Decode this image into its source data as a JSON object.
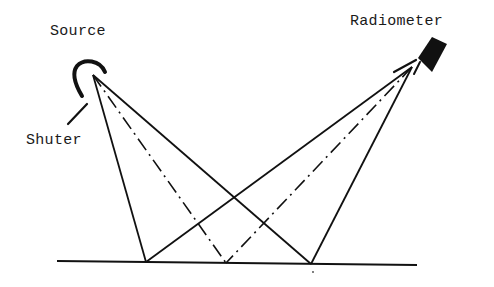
{
  "diagram": {
    "title": "",
    "labels": {
      "source": "Source",
      "shuter": "Shuter",
      "radiometer": "Radiometer"
    },
    "components": [
      {
        "name": "source",
        "icon": "lamp-reflector-icon"
      },
      {
        "name": "shutter",
        "icon": "shutter-arm-icon"
      },
      {
        "name": "radiometer",
        "icon": "radiometer-detector-icon"
      },
      {
        "name": "ground-surface",
        "icon": "surface-line"
      }
    ],
    "geometry": {
      "source_apex": [
        93,
        75
      ],
      "radiometer_apex": [
        412,
        67
      ],
      "surface_line": [
        [
          57,
          261
        ],
        [
          417,
          265
        ]
      ],
      "surface_points": {
        "left": [
          146,
          262
        ],
        "center": [
          226,
          263
        ],
        "right": [
          311,
          264
        ]
      }
    },
    "rays": [
      {
        "from": "source",
        "to": "left",
        "style": "solid"
      },
      {
        "from": "source",
        "to": "center",
        "style": "dash-dot"
      },
      {
        "from": "source",
        "to": "right",
        "style": "solid"
      },
      {
        "from": "radiometer",
        "to": "left",
        "style": "solid"
      },
      {
        "from": "radiometer",
        "to": "center",
        "style": "dash-dot"
      },
      {
        "from": "radiometer",
        "to": "right",
        "style": "solid"
      }
    ],
    "colors": {
      "line": "#111111",
      "background": "#ffffff"
    }
  }
}
